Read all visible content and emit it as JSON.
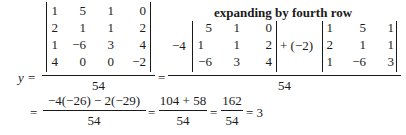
{
  "lhs": {
    "variable": "y",
    "equals": "="
  },
  "matrix4x4": {
    "rows": [
      [
        "1",
        "5",
        "1",
        "0"
      ],
      [
        "2",
        "1",
        "1",
        "2"
      ],
      [
        "1",
        "−6",
        "3",
        "4"
      ],
      [
        "4",
        "0",
        "0",
        "−2"
      ]
    ]
  },
  "denominator": "54",
  "annotation": "expanding by fourth row",
  "expansion": {
    "equals": "=",
    "coef1": "−4",
    "minor1": {
      "rows": [
        [
          "5",
          "1",
          "0"
        ],
        [
          "1",
          "1",
          "2"
        ],
        [
          "−6",
          "3",
          "4"
        ]
      ]
    },
    "coef2": "+ (−2)",
    "minor2": {
      "rows": [
        [
          "1",
          "5",
          "1"
        ],
        [
          "2",
          "1",
          "1"
        ],
        [
          "1",
          "−6",
          "3"
        ]
      ]
    },
    "denominator": "54"
  },
  "result_line": {
    "eq1": "=",
    "frac1": {
      "num": "−4(−26) − 2(−29)",
      "den": "54"
    },
    "eq2": "=",
    "frac2": {
      "num": "104 + 58",
      "den": "54"
    },
    "eq3": "=",
    "frac3": {
      "num": "162",
      "den": "54"
    },
    "eq4": "= 3"
  }
}
